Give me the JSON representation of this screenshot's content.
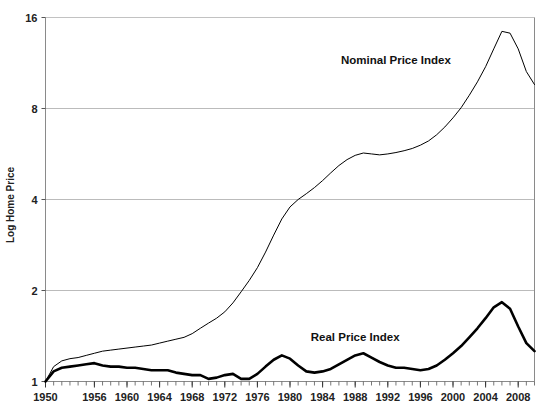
{
  "chart_data": {
    "type": "line",
    "title": "",
    "xlabel": "",
    "ylabel": "Log Home Price",
    "y_scale": "log2",
    "ylim": [
      1,
      16
    ],
    "yticks": [
      1,
      2,
      4,
      8,
      16
    ],
    "ytick_labels": [
      "1",
      "2",
      "4",
      "8",
      "16"
    ],
    "xlim": [
      1950,
      2010
    ],
    "xticks": [
      1950,
      1956,
      1960,
      1964,
      1968,
      1972,
      1976,
      1980,
      1984,
      1988,
      1992,
      1996,
      2000,
      2004,
      2008
    ],
    "xtick_labels": [
      "1950",
      "1956",
      "1960",
      "1964",
      "1968",
      "1972",
      "1976",
      "1980",
      "1984",
      "1988",
      "1992",
      "1996",
      "2000",
      "2004",
      "2008"
    ],
    "grid": true,
    "grid_color": "#b3b3b3",
    "legend_position": "inline-annotation",
    "series": [
      {
        "name": "Nominal Price Index",
        "color": "#000000",
        "line_width": 1,
        "label_x": 1993,
        "label_y": 11.2,
        "x": [
          1950,
          1951,
          1952,
          1953,
          1954,
          1955,
          1956,
          1957,
          1958,
          1959,
          1960,
          1961,
          1962,
          1963,
          1964,
          1965,
          1966,
          1967,
          1968,
          1969,
          1970,
          1971,
          1972,
          1973,
          1974,
          1975,
          1976,
          1977,
          1978,
          1979,
          1980,
          1981,
          1982,
          1983,
          1984,
          1985,
          1986,
          1987,
          1988,
          1989,
          1990,
          1991,
          1992,
          1993,
          1994,
          1995,
          1996,
          1997,
          1998,
          1999,
          2000,
          2001,
          2002,
          2003,
          2004,
          2005,
          2006,
          2007,
          2008,
          2009,
          2010
        ],
        "values": [
          1.0,
          1.12,
          1.17,
          1.19,
          1.2,
          1.22,
          1.24,
          1.26,
          1.27,
          1.28,
          1.29,
          1.3,
          1.31,
          1.32,
          1.34,
          1.36,
          1.38,
          1.4,
          1.44,
          1.5,
          1.56,
          1.62,
          1.7,
          1.82,
          1.98,
          2.16,
          2.38,
          2.68,
          3.05,
          3.45,
          3.78,
          4.0,
          4.18,
          4.38,
          4.62,
          4.9,
          5.18,
          5.42,
          5.6,
          5.7,
          5.66,
          5.62,
          5.66,
          5.72,
          5.8,
          5.9,
          6.05,
          6.25,
          6.55,
          6.95,
          7.45,
          8.05,
          8.85,
          9.8,
          11.0,
          12.6,
          14.4,
          14.2,
          12.6,
          10.6,
          9.6
        ]
      },
      {
        "name": "Real Price Index",
        "color": "#000000",
        "line_width": 2.6,
        "label_x": 1988,
        "label_y": 1.36,
        "x": [
          1950,
          1951,
          1952,
          1953,
          1954,
          1955,
          1956,
          1957,
          1958,
          1959,
          1960,
          1961,
          1962,
          1963,
          1964,
          1965,
          1966,
          1967,
          1968,
          1969,
          1970,
          1971,
          1972,
          1973,
          1974,
          1975,
          1976,
          1977,
          1978,
          1979,
          1980,
          1981,
          1982,
          1983,
          1984,
          1985,
          1986,
          1987,
          1988,
          1989,
          1990,
          1991,
          1992,
          1993,
          1994,
          1995,
          1996,
          1997,
          1998,
          1999,
          2000,
          2001,
          2002,
          2003,
          2004,
          2005,
          2006,
          2007,
          2008,
          2009,
          2010
        ],
        "values": [
          1.0,
          1.08,
          1.11,
          1.12,
          1.13,
          1.14,
          1.15,
          1.13,
          1.12,
          1.12,
          1.11,
          1.11,
          1.1,
          1.09,
          1.09,
          1.09,
          1.07,
          1.06,
          1.05,
          1.05,
          1.02,
          1.03,
          1.05,
          1.06,
          1.02,
          1.02,
          1.06,
          1.12,
          1.18,
          1.22,
          1.19,
          1.13,
          1.08,
          1.07,
          1.08,
          1.1,
          1.14,
          1.18,
          1.22,
          1.24,
          1.2,
          1.16,
          1.13,
          1.11,
          1.11,
          1.1,
          1.09,
          1.1,
          1.13,
          1.18,
          1.24,
          1.31,
          1.4,
          1.5,
          1.62,
          1.76,
          1.83,
          1.74,
          1.52,
          1.34,
          1.26
        ]
      }
    ]
  },
  "axis": {
    "y_title": "Log Home Price"
  }
}
